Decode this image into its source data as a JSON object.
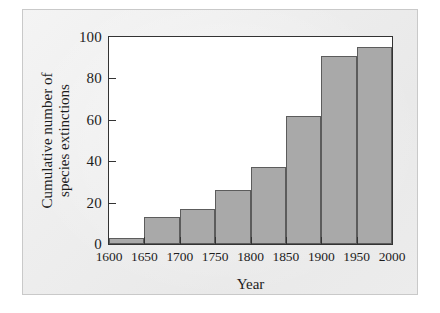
{
  "chart_data": {
    "type": "bar",
    "title": "",
    "xlabel": "Year",
    "ylabel": "Cumulative number of species extinctions",
    "ylabel_line1": "Cumulative number of",
    "ylabel_line2": "species extinctions",
    "categories": [
      "1600",
      "1650",
      "1700",
      "1750",
      "1800",
      "1850",
      "1900",
      "1950"
    ],
    "bin_edges": [
      "1600",
      "1650",
      "1700",
      "1750",
      "1800",
      "1850",
      "1900",
      "1950",
      "2000"
    ],
    "values": [
      3,
      13,
      17,
      26,
      37,
      62,
      91,
      95
    ],
    "xlim": [
      1600,
      2000
    ],
    "ylim": [
      0,
      100
    ],
    "xticks": [
      "1600",
      "1650",
      "1700",
      "1750",
      "1800",
      "1850",
      "1900",
      "1950",
      "2000"
    ],
    "yticks": [
      "0",
      "20",
      "40",
      "60",
      "80",
      "100"
    ],
    "ytick_values": [
      0,
      20,
      40,
      60,
      80,
      100
    ],
    "grid": false,
    "legend": false,
    "legend_position": "none",
    "bar_fill_color": "#a9a9a9",
    "bar_edge_color": "#5c5c5c",
    "axis_color": "#333333",
    "plot_background": "#ffffff",
    "figure_background": "#ececec",
    "annotations": []
  }
}
